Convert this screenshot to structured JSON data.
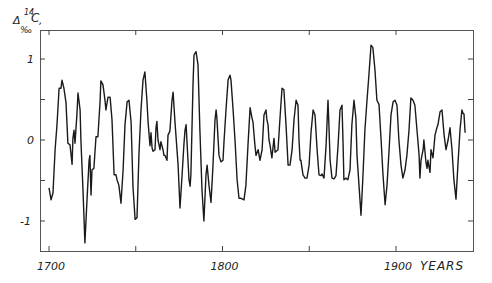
{
  "chart_data": {
    "type": "line",
    "title": "",
    "xlabel": "YEARS",
    "ylabel": "Δ‰ 14C",
    "ylabel_parts": {
      "delta": "Δ",
      "superscript": "14",
      "symbol": "C",
      "subscript": "‰"
    },
    "xlim": [
      1695,
      1945
    ],
    "ylim": [
      -1.4,
      1.4
    ],
    "x_ticks": [
      1700,
      1750,
      1800,
      1850,
      1900
    ],
    "x_tick_labels": [
      "1700",
      "",
      "1800",
      "",
      "1900"
    ],
    "y_ticks": [
      1,
      0.5,
      0,
      -0.5,
      -1
    ],
    "y_tick_labels": [
      "1",
      "",
      "0",
      "",
      "-1"
    ],
    "grid": false,
    "legend": null,
    "series": [
      {
        "name": "Δ14C",
        "color": "#1a1a1a",
        "points": [
          [
            1700.0,
            -0.59
          ],
          [
            1701.2,
            -0.74
          ],
          [
            1702.3,
            -0.65
          ],
          [
            1703.5,
            -0.12
          ],
          [
            1704.6,
            0.19
          ],
          [
            1705.8,
            0.64
          ],
          [
            1706.9,
            0.64
          ],
          [
            1707.5,
            0.74
          ],
          [
            1708.6,
            0.64
          ],
          [
            1709.8,
            0.46
          ],
          [
            1710.9,
            -0.04
          ],
          [
            1712.1,
            -0.06
          ],
          [
            1713.3,
            -0.3
          ],
          [
            1713.8,
            0.02
          ],
          [
            1714.4,
            0.12
          ],
          [
            1715.0,
            -0.04
          ],
          [
            1716.1,
            0.31
          ],
          [
            1716.7,
            0.58
          ],
          [
            1717.9,
            0.37
          ],
          [
            1718.4,
            0.0
          ],
          [
            1719.6,
            -0.62
          ],
          [
            1720.7,
            -1.27
          ],
          [
            1721.9,
            -0.74
          ],
          [
            1723.1,
            -0.25
          ],
          [
            1723.6,
            -0.19
          ],
          [
            1724.2,
            -0.68
          ],
          [
            1724.8,
            -0.37
          ],
          [
            1725.9,
            -0.35
          ],
          [
            1727.1,
            0.04
          ],
          [
            1728.2,
            0.04
          ],
          [
            1729.4,
            0.46
          ],
          [
            1729.9,
            0.73
          ],
          [
            1731.1,
            0.68
          ],
          [
            1732.3,
            0.49
          ],
          [
            1732.8,
            0.37
          ],
          [
            1734.0,
            0.53
          ],
          [
            1735.2,
            0.53
          ],
          [
            1736.3,
            0.25
          ],
          [
            1737.5,
            -0.43
          ],
          [
            1738.6,
            -0.43
          ],
          [
            1739.2,
            -0.49
          ],
          [
            1740.3,
            -0.56
          ],
          [
            1741.5,
            -0.78
          ],
          [
            1742.7,
            -0.37
          ],
          [
            1743.8,
            0.19
          ],
          [
            1745.0,
            0.47
          ],
          [
            1746.1,
            0.49
          ],
          [
            1747.3,
            0.22
          ],
          [
            1748.4,
            -0.58
          ],
          [
            1749.6,
            -0.98
          ],
          [
            1750.7,
            -0.96
          ],
          [
            1751.9,
            -0.16
          ],
          [
            1753.0,
            0.37
          ],
          [
            1754.2,
            0.74
          ],
          [
            1755.3,
            0.84
          ],
          [
            1756.5,
            0.47
          ],
          [
            1757.1,
            0.22
          ],
          [
            1758.2,
            -0.07
          ],
          [
            1758.8,
            0.09
          ],
          [
            1759.4,
            -0.1
          ],
          [
            1760.0,
            -0.14
          ],
          [
            1761.1,
            -0.12
          ],
          [
            1761.7,
            0.15
          ],
          [
            1762.2,
            0.23
          ],
          [
            1762.8,
            0.0
          ],
          [
            1764.0,
            -0.12
          ],
          [
            1764.5,
            -0.02
          ],
          [
            1765.7,
            -0.12
          ],
          [
            1766.3,
            -0.19
          ],
          [
            1766.9,
            -0.19
          ],
          [
            1768.0,
            -0.25
          ],
          [
            1768.6,
            0.06
          ],
          [
            1769.7,
            0.11
          ],
          [
            1770.9,
            0.49
          ],
          [
            1771.5,
            0.59
          ],
          [
            1772.6,
            0.22
          ],
          [
            1774.4,
            -0.31
          ],
          [
            1775.5,
            -0.84
          ],
          [
            1776.7,
            -0.43
          ],
          [
            1777.8,
            -0.04
          ],
          [
            1778.4,
            0.12
          ],
          [
            1779.0,
            0.19
          ],
          [
            1779.5,
            0.0
          ],
          [
            1780.7,
            -0.49
          ],
          [
            1781.3,
            -0.57
          ],
          [
            1781.8,
            -0.43
          ],
          [
            1783.0,
            0.68
          ],
          [
            1783.6,
            1.05
          ],
          [
            1784.7,
            1.09
          ],
          [
            1785.9,
            0.93
          ],
          [
            1787.0,
            0.12
          ],
          [
            1788.2,
            -0.62
          ],
          [
            1789.3,
            -1.0
          ],
          [
            1790.5,
            -0.43
          ],
          [
            1791.1,
            -0.31
          ],
          [
            1792.2,
            -0.56
          ],
          [
            1793.4,
            -0.77
          ],
          [
            1794.5,
            -0.31
          ],
          [
            1795.7,
            0.25
          ],
          [
            1796.3,
            0.37
          ],
          [
            1796.8,
            0.27
          ],
          [
            1798.0,
            -0.19
          ],
          [
            1799.1,
            -0.27
          ],
          [
            1800.3,
            -0.25
          ],
          [
            1800.9,
            0.0
          ],
          [
            1802.0,
            0.37
          ],
          [
            1803.2,
            0.74
          ],
          [
            1804.3,
            0.8
          ],
          [
            1804.9,
            0.74
          ],
          [
            1806.1,
            0.37
          ],
          [
            1807.2,
            0.0
          ],
          [
            1808.4,
            -0.49
          ],
          [
            1809.5,
            -0.72
          ],
          [
            1810.7,
            -0.72
          ],
          [
            1812.4,
            -0.74
          ],
          [
            1813.5,
            -0.56
          ],
          [
            1814.7,
            -0.06
          ],
          [
            1815.9,
            0.4
          ],
          [
            1817.0,
            0.27
          ],
          [
            1817.6,
            0.22
          ],
          [
            1818.7,
            -0.06
          ],
          [
            1819.3,
            -0.19
          ],
          [
            1820.5,
            -0.12
          ],
          [
            1821.6,
            -0.25
          ],
          [
            1822.8,
            -0.12
          ],
          [
            1823.9,
            0.31
          ],
          [
            1825.1,
            0.37
          ],
          [
            1825.6,
            0.25
          ],
          [
            1826.2,
            0.19
          ],
          [
            1826.8,
            0.0
          ],
          [
            1827.4,
            -0.06
          ],
          [
            1828.5,
            -0.22
          ],
          [
            1829.7,
            0.02
          ],
          [
            1830.3,
            -0.15
          ],
          [
            1832.0,
            -0.12
          ],
          [
            1833.1,
            0.25
          ],
          [
            1834.3,
            0.64
          ],
          [
            1835.4,
            0.62
          ],
          [
            1836.6,
            0.19
          ],
          [
            1837.8,
            -0.31
          ],
          [
            1838.9,
            -0.31
          ],
          [
            1840.1,
            -0.12
          ],
          [
            1841.2,
            0.25
          ],
          [
            1842.4,
            0.49
          ],
          [
            1843.5,
            0.43
          ],
          [
            1844.1,
            0.0
          ],
          [
            1844.7,
            -0.25
          ],
          [
            1845.2,
            -0.25
          ],
          [
            1846.4,
            -0.43
          ],
          [
            1847.6,
            -0.47
          ],
          [
            1848.7,
            -0.47
          ],
          [
            1849.9,
            -0.31
          ],
          [
            1851.0,
            0.09
          ],
          [
            1852.2,
            0.37
          ],
          [
            1853.3,
            0.31
          ],
          [
            1854.5,
            -0.12
          ],
          [
            1855.6,
            -0.43
          ],
          [
            1856.8,
            -0.44
          ],
          [
            1857.4,
            -0.42
          ],
          [
            1858.5,
            -0.47
          ],
          [
            1859.7,
            -0.06
          ],
          [
            1860.8,
            0.49
          ],
          [
            1861.4,
            0.15
          ],
          [
            1862.0,
            -0.25
          ],
          [
            1863.1,
            -0.47
          ],
          [
            1864.3,
            -0.48
          ],
          [
            1865.4,
            -0.44
          ],
          [
            1866.6,
            -0.06
          ],
          [
            1867.7,
            0.37
          ],
          [
            1868.9,
            0.43
          ],
          [
            1869.5,
            -0.06
          ],
          [
            1870.0,
            -0.49
          ],
          [
            1871.2,
            -0.47
          ],
          [
            1872.3,
            -0.49
          ],
          [
            1873.5,
            -0.37
          ],
          [
            1874.6,
            0.19
          ],
          [
            1875.8,
            0.49
          ],
          [
            1876.9,
            0.27
          ],
          [
            1877.5,
            -0.19
          ],
          [
            1878.7,
            -0.56
          ],
          [
            1879.8,
            -0.93
          ],
          [
            1881.0,
            -0.43
          ],
          [
            1882.1,
            0.12
          ],
          [
            1883.3,
            0.49
          ],
          [
            1884.4,
            0.8
          ],
          [
            1885.6,
            1.17
          ],
          [
            1886.7,
            1.14
          ],
          [
            1887.9,
            0.86
          ],
          [
            1889.0,
            0.49
          ],
          [
            1890.2,
            0.44
          ],
          [
            1891.4,
            0.0
          ],
          [
            1892.5,
            -0.43
          ],
          [
            1893.7,
            -0.8
          ],
          [
            1894.8,
            -0.56
          ],
          [
            1896.0,
            -0.12
          ],
          [
            1897.1,
            0.31
          ],
          [
            1898.3,
            0.47
          ],
          [
            1899.4,
            0.49
          ],
          [
            1900.6,
            0.43
          ],
          [
            1901.7,
            0.0
          ],
          [
            1902.9,
            -0.31
          ],
          [
            1904.0,
            -0.47
          ],
          [
            1905.2,
            -0.37
          ],
          [
            1906.3,
            -0.19
          ],
          [
            1907.5,
            0.12
          ],
          [
            1908.6,
            0.52
          ],
          [
            1909.8,
            0.49
          ],
          [
            1910.9,
            0.43
          ],
          [
            1912.1,
            0.12
          ],
          [
            1913.3,
            -0.19
          ],
          [
            1913.8,
            -0.47
          ],
          [
            1914.4,
            -0.25
          ],
          [
            1915.6,
            -0.12
          ],
          [
            1916.1,
            0.0
          ],
          [
            1917.3,
            -0.28
          ],
          [
            1917.9,
            -0.35
          ],
          [
            1918.4,
            -0.25
          ],
          [
            1919.6,
            -0.4
          ],
          [
            1920.2,
            -0.12
          ],
          [
            1921.3,
            -0.22
          ],
          [
            1922.5,
            0.06
          ],
          [
            1923.6,
            0.15
          ],
          [
            1924.2,
            0.19
          ],
          [
            1925.4,
            0.35
          ],
          [
            1926.5,
            0.37
          ],
          [
            1927.7,
            0.06
          ],
          [
            1928.8,
            -0.12
          ],
          [
            1930.0,
            0.0
          ],
          [
            1931.1,
            0.15
          ],
          [
            1932.3,
            -0.12
          ],
          [
            1933.4,
            -0.49
          ],
          [
            1934.6,
            -0.73
          ],
          [
            1935.7,
            -0.31
          ],
          [
            1936.9,
            0.12
          ],
          [
            1938.0,
            0.37
          ],
          [
            1938.6,
            0.33
          ],
          [
            1939.2,
            0.32
          ],
          [
            1939.8,
            0.09
          ]
        ]
      }
    ]
  },
  "labels": {
    "y_axis_delta": "Δ",
    "y_axis_superscript": "14",
    "y_axis_symbol": "C",
    "y_axis_permil": "‰",
    "y_axis_comma": ",",
    "x_axis_title": "YEARS"
  }
}
